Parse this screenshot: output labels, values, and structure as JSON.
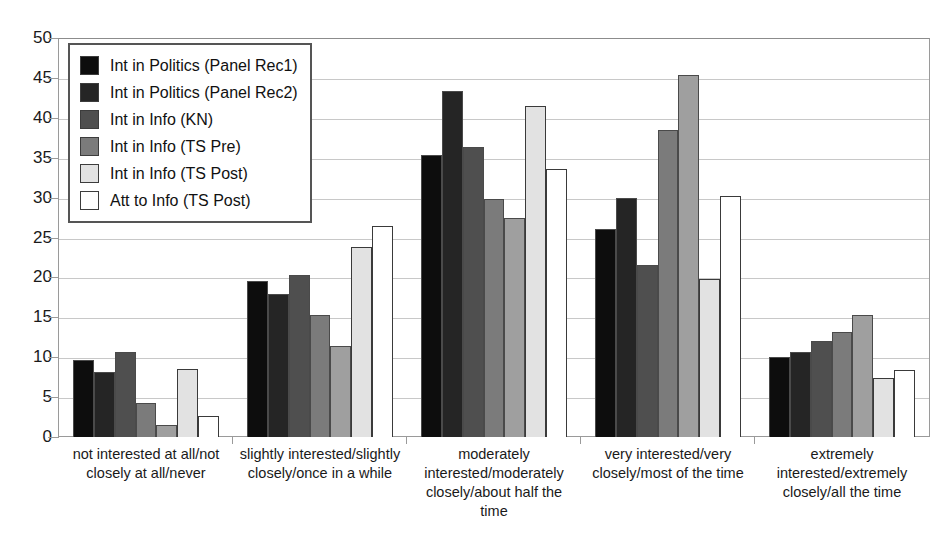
{
  "chart_data": {
    "type": "bar",
    "title": "",
    "xlabel": "",
    "ylabel": "",
    "ylim": [
      0,
      50
    ],
    "ytick_step": 5,
    "yticks": [
      0,
      5,
      10,
      15,
      20,
      25,
      30,
      35,
      40,
      45,
      50
    ],
    "grid": true,
    "legend_position": "top-left",
    "categories": [
      "not interested at all/not closely at all/never",
      "slightly interested/slightly closely/once in a while",
      "moderately interested/moderately closely/about half the time",
      "very interested/very closely/most of the time",
      "extremely interested/extremely closely/all the time"
    ],
    "series": [
      {
        "name": "Int in Politics (Panel Rec1)",
        "color": "#0d0d0d",
        "values": [
          9.6,
          19.5,
          35.3,
          26.1,
          10.0
        ]
      },
      {
        "name": "Int in Politics (Panel Rec2)",
        "color": "#252525",
        "values": [
          8.1,
          17.9,
          43.4,
          30.0,
          10.7
        ]
      },
      {
        "name": "Int in Info (KN)",
        "color": "#4f4f4f",
        "values": [
          10.6,
          20.3,
          36.3,
          21.5,
          12.0
        ]
      },
      {
        "name": "Int in Info (TS Pre)",
        "color": "#7b7b7b",
        "values": [
          4.3,
          15.3,
          29.8,
          38.5,
          13.1
        ]
      },
      {
        "name": "Int in Info (TS Post)",
        "color": "#9f9f9f",
        "values": [
          1.5,
          11.4,
          27.4,
          45.4,
          15.3
        ]
      },
      {
        "name": "Att to Info (TS Post)",
        "color": "#e2e2e2",
        "values": [
          8.5,
          23.8,
          41.5,
          19.8,
          7.4
        ]
      },
      {
        "name": "Att to Info (TS Post) open",
        "color": "#ffffff",
        "values": [
          2.6,
          26.5,
          33.6,
          30.2,
          8.4
        ]
      }
    ]
  },
  "legend": {
    "items": [
      {
        "label": "Int in Politics (Panel Rec1)",
        "color": "#0d0d0d"
      },
      {
        "label": "Int in Politics (Panel Rec2)",
        "color": "#252525"
      },
      {
        "label": "Int in Info (KN)",
        "color": "#4f4f4f"
      },
      {
        "label": "Int in Info (TS Pre)",
        "color": "#7b7b7b"
      },
      {
        "label": "Int in Info (TS Post)",
        "color": "#e2e2e2"
      },
      {
        "label": "Att to Info (TS Post)",
        "color": "#ffffff"
      }
    ]
  }
}
